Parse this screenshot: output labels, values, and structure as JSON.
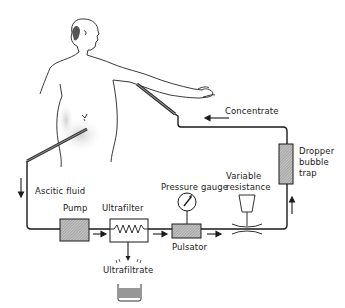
{
  "diagram": {
    "type": "ascitic-fluid-ultrafiltration-circuit",
    "labels": {
      "concentrate": "Concentrate",
      "dropper_line1": "Dropper",
      "dropper_line2": "bubble",
      "dropper_line3": "trap",
      "variable_line1": "Variable",
      "variable_line2": "resistance",
      "pressure_gauge": "Pressure gauge",
      "ascitic_fluid": "Ascitic fluid",
      "pump": "Pump",
      "ultrafilter": "Ultrafilter",
      "pulsator": "Pulsator",
      "ultrafiltrate": "Ultrafiltrate"
    },
    "components": [
      "Patient",
      "Pump",
      "Ultrafilter",
      "Pressure gauge",
      "Pulsator",
      "Variable resistance",
      "Dropper bubble trap",
      "Ultrafiltrate collector"
    ],
    "flow": [
      "Patient abdomen",
      "Ascitic fluid",
      "Pump",
      "Ultrafilter",
      "Pulsator",
      "Variable resistance",
      "Dropper bubble trap",
      "Concentrate",
      "Patient arm vein"
    ],
    "colors": {
      "line": "#1a1a1a",
      "hatch": "#9a9a9a",
      "background": "#ffffff"
    }
  }
}
